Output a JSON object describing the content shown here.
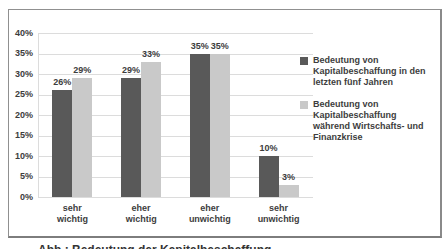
{
  "chart_data": {
    "type": "bar",
    "title": "",
    "xlabel": "",
    "ylabel": "",
    "categories": [
      "sehr wichtig",
      "eher wichtig",
      "eher unwichtig",
      "sehr unwichtig"
    ],
    "series": [
      {
        "name": "Bedeutung von Kapitalbeschaffung in den letzten fünf Jahren",
        "label_lines": [
          "Bedeutung von",
          "Kapitalbeschaffung in den",
          "letzten fünf Jahren"
        ],
        "color": "#595959",
        "values": [
          26,
          29,
          35,
          10
        ]
      },
      {
        "name": "Bedeutung von Kapitalbeschaffung während Wirtschafts- und Finanzkrise",
        "label_lines": [
          "Bedeutung von",
          "Kapitalbeschaffung",
          "während Wirtschafts- und",
          "Finanzkrise"
        ],
        "color": "#c9c9c9",
        "values": [
          29,
          33,
          35,
          3
        ]
      }
    ],
    "data_labels": [
      [
        "26%",
        "29%"
      ],
      [
        "29%",
        "33%"
      ],
      [
        "35%",
        "35%"
      ],
      [
        "10%",
        "3%"
      ]
    ],
    "ytick_labels": [
      "0%",
      "5%",
      "10%",
      "15%",
      "20%",
      "25%",
      "30%",
      "35%",
      "40%"
    ],
    "ylim": [
      0,
      40
    ],
    "ytick_step": 5,
    "grid": true,
    "legend_position": "right"
  },
  "caption_partial": "Abb.: Bedeutung der Kapitalbeschaffung",
  "colors": {
    "series1": "#595959",
    "series2": "#c9c9c9",
    "gridline": "#dcdcdc",
    "text": "#3d3d3d",
    "frame_border": "#8c8c8c",
    "background": "#ffffff"
  }
}
